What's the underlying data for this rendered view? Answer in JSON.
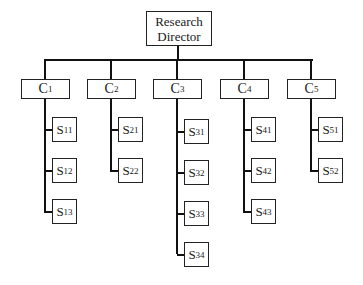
{
  "director": {
    "line1": "Research",
    "line2": "Director"
  },
  "columns": [
    {
      "label": "C",
      "sub": "1",
      "children": [
        {
          "label": "S",
          "sub": "11"
        },
        {
          "label": "S",
          "sub": "12"
        },
        {
          "label": "S",
          "sub": "13"
        }
      ]
    },
    {
      "label": "C",
      "sub": "2",
      "children": [
        {
          "label": "S",
          "sub": "21"
        },
        {
          "label": "S",
          "sub": "22"
        }
      ]
    },
    {
      "label": "C",
      "sub": "3",
      "children": [
        {
          "label": "S",
          "sub": "31"
        },
        {
          "label": "S",
          "sub": "32"
        },
        {
          "label": "S",
          "sub": "33"
        },
        {
          "label": "S",
          "sub": "34"
        }
      ]
    },
    {
      "label": "C",
      "sub": "4",
      "children": [
        {
          "label": "S",
          "sub": "41"
        },
        {
          "label": "S",
          "sub": "42"
        },
        {
          "label": "S",
          "sub": "43"
        }
      ]
    },
    {
      "label": "C",
      "sub": "5",
      "children": [
        {
          "label": "S",
          "sub": "51"
        },
        {
          "label": "S",
          "sub": "52"
        }
      ]
    }
  ]
}
